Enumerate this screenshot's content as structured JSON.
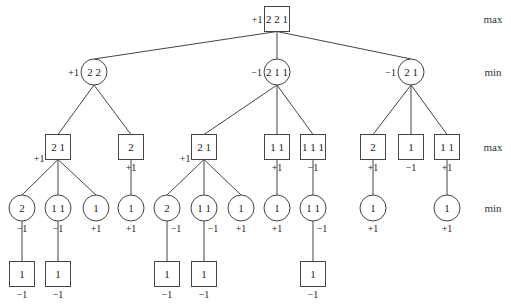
{
  "levels": [
    {
      "label": "max",
      "y": 19
    },
    {
      "label": "min",
      "y": 72
    },
    {
      "label": "max",
      "y": 147
    },
    {
      "label": "min",
      "y": 208
    }
  ],
  "nodes": [
    {
      "id": "r",
      "shape": "box",
      "x": 277,
      "y": 19,
      "label": "2 2 1",
      "value": "+1",
      "vpos": "left"
    },
    {
      "id": "a",
      "shape": "circle",
      "x": 94,
      "y": 72,
      "label": "2 2",
      "value": "+1",
      "vpos": "left",
      "parent": "r"
    },
    {
      "id": "b",
      "shape": "circle",
      "x": 277,
      "y": 72,
      "label": "2 1 1",
      "value": "−1",
      "vpos": "left",
      "parent": "r"
    },
    {
      "id": "c",
      "shape": "circle",
      "x": 411,
      "y": 72,
      "label": "2 1",
      "value": "−1",
      "vpos": "left",
      "parent": "r"
    },
    {
      "id": "a1",
      "shape": "box",
      "x": 58,
      "y": 147,
      "label": "2 1",
      "value": "+1",
      "vpos": "lowleft",
      "parent": "a"
    },
    {
      "id": "a2",
      "shape": "box",
      "x": 131,
      "y": 147,
      "label": "2",
      "value": "+1",
      "vpos": "below",
      "parent": "a"
    },
    {
      "id": "b1",
      "shape": "box",
      "x": 204,
      "y": 147,
      "label": "2 1",
      "value": "+1",
      "vpos": "lowleft",
      "parent": "b"
    },
    {
      "id": "b2",
      "shape": "box",
      "x": 277,
      "y": 147,
      "label": "1 1",
      "value": "+1",
      "vpos": "below",
      "parent": "b"
    },
    {
      "id": "b3",
      "shape": "box",
      "x": 313,
      "y": 147,
      "label": "1 1 1",
      "value": "−1",
      "vpos": "below",
      "parent": "b"
    },
    {
      "id": "c1",
      "shape": "box",
      "x": 373,
      "y": 147,
      "label": "2",
      "value": "+1",
      "vpos": "below",
      "parent": "c"
    },
    {
      "id": "c2",
      "shape": "box",
      "x": 411,
      "y": 147,
      "label": "1",
      "value": "−1",
      "vpos": "below",
      "parent": "c"
    },
    {
      "id": "c3",
      "shape": "box",
      "x": 447,
      "y": 147,
      "label": "1 1",
      "value": "+1",
      "vpos": "below",
      "parent": "c"
    },
    {
      "id": "a1a",
      "shape": "circle",
      "x": 22,
      "y": 208,
      "label": "2",
      "value": "−1",
      "vpos": "below",
      "parent": "a1"
    },
    {
      "id": "a1b",
      "shape": "circle",
      "x": 58,
      "y": 208,
      "label": "1 1",
      "value": "−1",
      "vpos": "below",
      "parent": "a1"
    },
    {
      "id": "a1c",
      "shape": "circle",
      "x": 96,
      "y": 208,
      "label": "1",
      "value": "+1",
      "vpos": "below",
      "parent": "a1"
    },
    {
      "id": "a2a",
      "shape": "circle",
      "x": 131,
      "y": 208,
      "label": "1",
      "value": "+1",
      "vpos": "below",
      "parent": "a2"
    },
    {
      "id": "b1a",
      "shape": "circle",
      "x": 167,
      "y": 208,
      "label": "2",
      "value": "−1",
      "vpos": "belowright",
      "parent": "b1"
    },
    {
      "id": "b1b",
      "shape": "circle",
      "x": 204,
      "y": 208,
      "label": "1 1",
      "value": "−1",
      "vpos": "belowright",
      "parent": "b1"
    },
    {
      "id": "b1c",
      "shape": "circle",
      "x": 241,
      "y": 208,
      "label": "1",
      "value": "+1",
      "vpos": "below",
      "parent": "b1"
    },
    {
      "id": "b2a",
      "shape": "circle",
      "x": 277,
      "y": 208,
      "label": "1",
      "value": "+1",
      "vpos": "below",
      "parent": "b2"
    },
    {
      "id": "b3a",
      "shape": "circle",
      "x": 313,
      "y": 208,
      "label": "1 1",
      "value": "−1",
      "vpos": "belowright",
      "parent": "b3"
    },
    {
      "id": "c1a",
      "shape": "circle",
      "x": 373,
      "y": 208,
      "label": "1",
      "value": "+1",
      "vpos": "below",
      "parent": "c1"
    },
    {
      "id": "c3a",
      "shape": "circle",
      "x": 447,
      "y": 208,
      "label": "1",
      "value": "+1",
      "vpos": "below",
      "parent": "c3"
    },
    {
      "id": "a1a1",
      "shape": "box",
      "x": 22,
      "y": 274,
      "label": "1",
      "value": "−1",
      "vpos": "below",
      "parent": "a1a"
    },
    {
      "id": "a1b1",
      "shape": "box",
      "x": 58,
      "y": 274,
      "label": "1",
      "value": "−1",
      "vpos": "below",
      "parent": "a1b"
    },
    {
      "id": "b1a1",
      "shape": "box",
      "x": 167,
      "y": 274,
      "label": "1",
      "value": "−1",
      "vpos": "below",
      "parent": "b1a"
    },
    {
      "id": "b1b1",
      "shape": "box",
      "x": 204,
      "y": 274,
      "label": "1",
      "value": "−1",
      "vpos": "below",
      "parent": "b1b"
    },
    {
      "id": "b3a1",
      "shape": "box",
      "x": 313,
      "y": 274,
      "label": "1",
      "value": "−1",
      "vpos": "below",
      "parent": "b3a"
    }
  ],
  "colors": {
    "stroke": "#444444",
    "text": "#222222",
    "background": "#ffffff"
  }
}
